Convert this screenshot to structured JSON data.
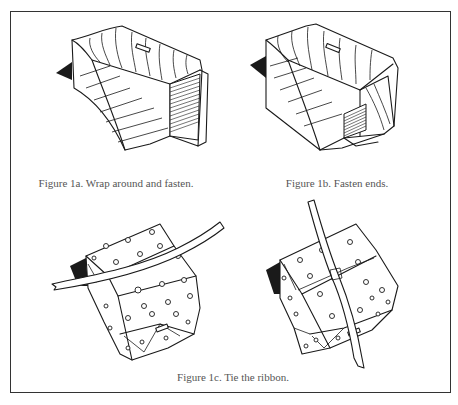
{
  "figure": {
    "panels": [
      {
        "id": "1a",
        "caption": "Figure 1a. Wrap around and fasten.",
        "illustration": "box-partially-wrapped-striped-paper"
      },
      {
        "id": "1b",
        "caption": "Figure 1b. Fasten ends.",
        "illustration": "box-ends-folded-striped-paper"
      },
      {
        "id": "1c",
        "caption": "Figure 1c. Tie the ribbon.",
        "illustrations": [
          "wrapped-box-ribbon-horizontal",
          "wrapped-box-ribbon-vertical"
        ]
      }
    ],
    "colors": {
      "ink": "#1a1a1a",
      "caption_text": "#555555",
      "border": "#333333",
      "background": "#ffffff"
    }
  }
}
